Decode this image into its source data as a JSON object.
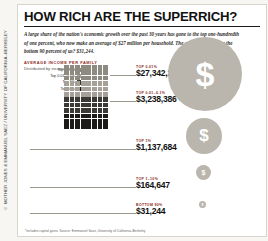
{
  "side_credit": "© MOTHER JONES & EMMANUEL SAEZ / UNIVERSITY OF CALIFORNIA–BERKELEY",
  "header": {
    "title": "HOW RICH ARE THE SUPERRICH?",
    "deck": "A large share of the nation's economic growth over the past 30 years has gone to the top one-hundredth of one percent, who now make an average of $27 million per household. The average income for the bottom 90 percent of us? $31,244."
  },
  "chart_label": "AVERAGE INCOME PER FAMILY",
  "chart_sublabel": "Distributed by income group",
  "legend": [
    {
      "label": "Top 0.01%",
      "color": "#8d8a82"
    },
    {
      "label": "Top 0.01–0.1%",
      "color": "#a5a199"
    },
    {
      "label": "Top 1%",
      "color": "#3c3a36"
    },
    {
      "label": "Top 10%",
      "color": "#1c1b19"
    }
  ],
  "footer": "*includes capital gains. Source: Emmanuel Saez, University of California–Berkeley",
  "chart_data": {
    "type": "bar",
    "title": "AVERAGE INCOME PER FAMILY",
    "subtitle": "Distributed by income group",
    "xlabel": "",
    "ylabel": "Average income per family (USD)",
    "categories": [
      "TOP 0.01%",
      "TOP 0.01–0.1%",
      "TOP 1%",
      "TOP 1–10%",
      "BOTTOM 90%"
    ],
    "values": [
      27342212,
      3238386,
      1137684,
      164647,
      31244
    ],
    "value_labels": [
      "$27,342,212",
      "$3,238,386",
      "$1,137,684",
      "$164,647",
      "$31,244"
    ],
    "encoding": "area-proportional circles",
    "note": "Circle area scales with average family income",
    "legend_position": "left",
    "grid": false
  },
  "rows": [
    {
      "group": "TOP 0.01%",
      "amount": "$27,342,212"
    },
    {
      "group": "TOP 0.01–0.1%",
      "amount": "$3,238,386"
    },
    {
      "group": "TOP 1%",
      "amount": "$1,137,684"
    },
    {
      "group": "TOP 1–10%",
      "amount": "$164,647"
    },
    {
      "group": "BOTTOM 90%",
      "amount": "$31,244"
    }
  ]
}
